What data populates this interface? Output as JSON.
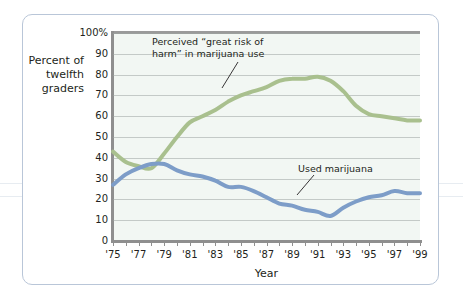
{
  "figure": {
    "background_color": "#ffffff",
    "frame_color": "#b9c6d8",
    "plot_background_color": "#f2f7f3"
  },
  "axis_titles": {
    "y": "Percent\nof\ntwelfth\ngraders",
    "x": "Year"
  },
  "annotations": {
    "risk": "Perceived “great risk of\nharm” in marijuana use",
    "used": "Used marijuana"
  },
  "chart_data": {
    "type": "line",
    "title": "",
    "subtitle": "",
    "xlabel": "Year",
    "ylabel": "Percent of twelfth graders",
    "xlim": [
      1975,
      1999
    ],
    "ylim": [
      0,
      100
    ],
    "grid": true,
    "legend_position": "inline-annotations",
    "y_ticks": [
      0,
      10,
      20,
      30,
      40,
      50,
      60,
      70,
      80,
      90,
      100
    ],
    "y_tick_labels": [
      "0",
      "10",
      "20",
      "30",
      "40",
      "50",
      "60",
      "70",
      "80",
      "90",
      "100%"
    ],
    "x_ticks": [
      1975,
      1976,
      1977,
      1978,
      1979,
      1980,
      1981,
      1982,
      1983,
      1984,
      1985,
      1986,
      1987,
      1988,
      1989,
      1990,
      1991,
      1992,
      1993,
      1994,
      1995,
      1996,
      1997,
      1998,
      1999
    ],
    "x_tick_labels": [
      "'75",
      "",
      "'77",
      "",
      "'79",
      "",
      "'81",
      "",
      "'83",
      "",
      "'85",
      "",
      "'87",
      "",
      "'89",
      "",
      "'91",
      "",
      "'93",
      "",
      "'95",
      "",
      "'97",
      "",
      "'99"
    ],
    "x": [
      1975,
      1976,
      1977,
      1978,
      1979,
      1980,
      1981,
      1982,
      1983,
      1984,
      1985,
      1986,
      1987,
      1988,
      1989,
      1990,
      1991,
      1992,
      1993,
      1994,
      1995,
      1996,
      1997,
      1998,
      1999
    ],
    "series": [
      {
        "name": "Perceived “great risk of harm” in marijuana use",
        "color": "#a9c08e",
        "values": [
          43,
          38,
          36,
          35,
          42,
          50,
          57,
          60,
          63,
          67,
          70,
          72,
          74,
          77,
          78,
          78,
          79,
          77,
          72,
          65,
          61,
          60,
          59,
          58,
          58
        ]
      },
      {
        "name": "Used marijuana",
        "color": "#7d9dc8",
        "values": [
          27,
          32,
          35,
          37,
          37,
          34,
          32,
          31,
          29,
          26,
          26,
          24,
          21,
          18,
          17,
          15,
          14,
          12,
          16,
          19,
          21,
          22,
          24,
          23,
          23
        ]
      }
    ]
  }
}
